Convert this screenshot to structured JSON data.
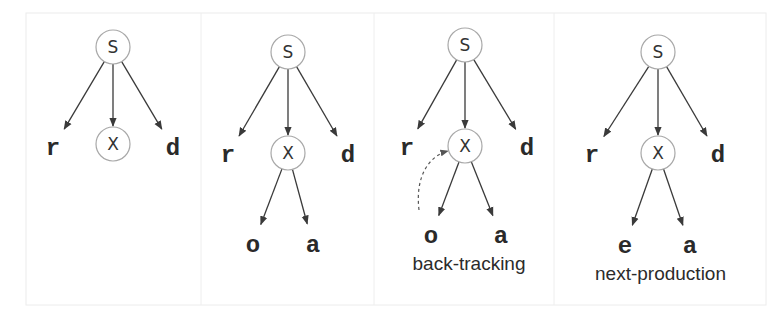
{
  "diagram": {
    "type": "parse-tree-steps",
    "panels": [
      {
        "id": "step1",
        "root": {
          "label": "S",
          "x": 113,
          "y": 47
        },
        "children": [
          {
            "label": "r",
            "kind": "terminal",
            "x": 53,
            "y": 148
          },
          {
            "label": "X",
            "kind": "nonterminal",
            "x": 113,
            "y": 144
          },
          {
            "label": "d",
            "kind": "terminal",
            "x": 173,
            "y": 148
          }
        ],
        "grandchildren": [],
        "caption": ""
      },
      {
        "id": "step2",
        "root": {
          "label": "S",
          "x": 288,
          "y": 52
        },
        "children": [
          {
            "label": "r",
            "kind": "terminal",
            "x": 228,
            "y": 155
          },
          {
            "label": "X",
            "kind": "nonterminal",
            "x": 288,
            "y": 153
          },
          {
            "label": "d",
            "kind": "terminal",
            "x": 348,
            "y": 155
          }
        ],
        "grandchildren": [
          {
            "label": "o",
            "x": 253,
            "y": 245
          },
          {
            "label": "a",
            "x": 313,
            "y": 245
          }
        ],
        "caption": ""
      },
      {
        "id": "step3",
        "root": {
          "label": "S",
          "x": 465,
          "y": 45
        },
        "children": [
          {
            "label": "r",
            "kind": "terminal",
            "x": 407,
            "y": 148
          },
          {
            "label": "X",
            "kind": "nonterminal",
            "x": 465,
            "y": 146
          },
          {
            "label": "d",
            "kind": "terminal",
            "x": 527,
            "y": 148
          }
        ],
        "grandchildren": [
          {
            "label": "o",
            "x": 431,
            "y": 236
          },
          {
            "label": "a",
            "x": 501,
            "y": 236
          }
        ],
        "backtrack_arrow": true,
        "caption": "back-tracking"
      },
      {
        "id": "step4",
        "root": {
          "label": "S",
          "x": 658,
          "y": 52
        },
        "children": [
          {
            "label": "r",
            "kind": "terminal",
            "x": 592,
            "y": 155
          },
          {
            "label": "X",
            "kind": "nonterminal",
            "x": 658,
            "y": 153
          },
          {
            "label": "d",
            "kind": "terminal",
            "x": 718,
            "y": 155
          }
        ],
        "grandchildren": [
          {
            "label": "e",
            "x": 625,
            "y": 246
          },
          {
            "label": "a",
            "x": 690,
            "y": 246
          }
        ],
        "caption": "next-production"
      }
    ],
    "colors": {
      "edge": "#3a3a3a",
      "node_border": "#a8a8a8",
      "text": "#2a2a2a",
      "frame": "#ececec"
    }
  }
}
